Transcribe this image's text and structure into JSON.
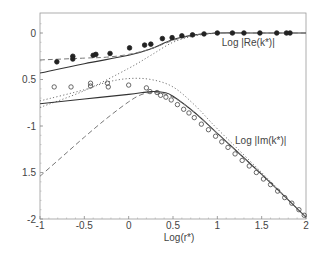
{
  "chart_data": {
    "type": "scatter",
    "title": "",
    "xlabel": "Log(r*)",
    "ylabel": "",
    "xlim": [
      -1,
      2
    ],
    "ylim": [
      -2,
      0.2
    ],
    "grid": false,
    "x_ticks": [
      {
        "value": -1,
        "label": "-1"
      },
      {
        "value": -0.5,
        "label": "-0.5"
      },
      {
        "value": 0,
        "label": "0"
      },
      {
        "value": 0.5,
        "label": "0.5"
      },
      {
        "value": 1,
        "label": "1"
      },
      {
        "value": 1.5,
        "label": "1.5"
      },
      {
        "value": 2,
        "label": "2"
      }
    ],
    "y_ticks": [
      {
        "value": 0,
        "label": "0"
      },
      {
        "value": -0.5,
        "label": "0.5"
      },
      {
        "value": -1,
        "label": "-1"
      },
      {
        "value": -1.5,
        "label": "1.5"
      },
      {
        "value": -2,
        "label": "-2"
      }
    ],
    "annotations": [
      {
        "text": "Log |Re(k*)|",
        "x": 1.05,
        "y": -0.1
      },
      {
        "text": "Log |Im(k*)|",
        "x": 1.2,
        "y": -1.15
      }
    ],
    "series": [
      {
        "name": "Re data (filled)",
        "kind": "points",
        "marker": "filled-circle",
        "color": "#222222",
        "x": [
          -0.81,
          -0.63,
          -0.63,
          -0.4,
          -0.37,
          -0.21,
          0.01,
          0.18,
          0.25,
          0.38,
          0.49,
          0.6,
          0.72,
          0.85,
          1.0,
          1.17,
          1.3,
          1.48,
          1.67,
          1.78,
          1.82
        ],
        "y": [
          -0.31,
          -0.28,
          -0.25,
          -0.24,
          -0.23,
          -0.22,
          -0.16,
          -0.13,
          -0.12,
          -0.06,
          -0.05,
          -0.03,
          -0.02,
          -0.01,
          0.0,
          0.0,
          0.0,
          0.0,
          0.0,
          0.0,
          0.0
        ]
      },
      {
        "name": "Im data (open)",
        "kind": "points",
        "marker": "open-circle",
        "color": "#444444",
        "x": [
          -0.84,
          -0.65,
          -0.43,
          -0.43,
          -0.24,
          -0.23,
          0.0,
          0.2,
          0.24,
          0.32,
          0.36,
          0.42,
          0.48,
          0.55,
          0.62,
          0.68,
          0.74,
          0.82,
          0.9,
          0.98,
          1.05,
          1.12,
          1.2,
          1.28,
          1.36,
          1.44,
          1.52,
          1.6,
          1.68,
          1.76,
          1.84,
          1.92,
          1.98
        ],
        "y": [
          -0.58,
          -0.58,
          -0.54,
          -0.57,
          -0.54,
          -0.58,
          -0.56,
          -0.59,
          -0.63,
          -0.64,
          -0.67,
          -0.69,
          -0.72,
          -0.77,
          -0.82,
          -0.86,
          -0.91,
          -0.98,
          -1.04,
          -1.11,
          -1.17,
          -1.23,
          -1.3,
          -1.37,
          -1.43,
          -1.5,
          -1.57,
          -1.63,
          -1.7,
          -1.77,
          -1.83,
          -1.9,
          -1.96
        ]
      },
      {
        "name": "Re model (solid)",
        "kind": "line",
        "style": "solid",
        "color": "#333333",
        "x": [
          -1,
          -0.5,
          0,
          0.25,
          0.5,
          0.75,
          1.0,
          1.5,
          2.0
        ],
        "y": [
          -0.43,
          -0.33,
          -0.24,
          -0.17,
          -0.07,
          -0.02,
          0.0,
          0.0,
          0.0
        ]
      },
      {
        "name": "Re model (dashed)",
        "kind": "line",
        "style": "dashed",
        "color": "#777777",
        "x": [
          -1,
          -0.5,
          -0.25,
          0,
          0.25,
          0.5,
          0.75,
          1.0,
          1.5,
          2.0
        ],
        "y": [
          -0.29,
          -0.27,
          -0.26,
          -0.23,
          -0.17,
          -0.08,
          -0.02,
          0.0,
          0.0,
          0.0
        ]
      },
      {
        "name": "Re model (dotted)",
        "kind": "line",
        "style": "dotted",
        "color": "#777777",
        "x": [
          -1,
          -0.5,
          0,
          0.25,
          0.5,
          0.75,
          1.0
        ],
        "y": [
          -0.8,
          -0.62,
          -0.38,
          -0.24,
          -0.1,
          -0.03,
          0.0
        ]
      },
      {
        "name": "Im model (solid)",
        "kind": "line",
        "style": "solid",
        "color": "#333333",
        "x": [
          -1,
          -0.5,
          0,
          0.25,
          0.4,
          0.5,
          0.75,
          1.0,
          1.5,
          2.0
        ],
        "y": [
          -0.76,
          -0.71,
          -0.66,
          -0.63,
          -0.64,
          -0.68,
          -0.86,
          -1.08,
          -1.52,
          -1.98
        ]
      },
      {
        "name": "Im model (dashed)",
        "kind": "line",
        "style": "dashed",
        "color": "#777777",
        "x": [
          -1,
          -0.75,
          -0.5,
          -0.25,
          0,
          0.15,
          0.3,
          0.5,
          0.75,
          1.0,
          1.5,
          2.0
        ],
        "y": [
          -1.54,
          -1.33,
          -1.12,
          -0.92,
          -0.74,
          -0.66,
          -0.64,
          -0.69,
          -0.86,
          -1.08,
          -1.52,
          -1.98
        ]
      },
      {
        "name": "Im model (dotted)",
        "kind": "line",
        "style": "dotted",
        "color": "#777777",
        "x": [
          -1,
          -0.5,
          -0.25,
          0,
          0.25,
          0.5,
          0.75,
          1.0,
          1.5,
          2.0
        ],
        "y": [
          -0.73,
          -0.61,
          -0.53,
          -0.49,
          -0.5,
          -0.58,
          -0.78,
          -1.03,
          -1.5,
          -1.98
        ]
      }
    ]
  }
}
